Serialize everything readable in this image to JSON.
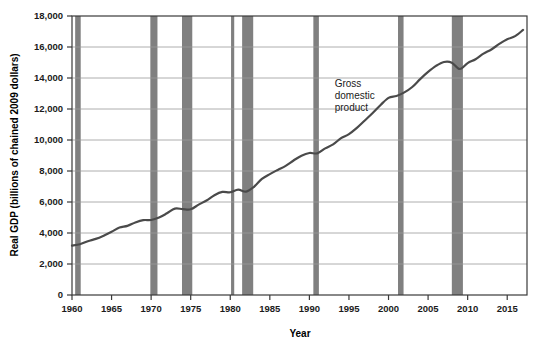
{
  "chart_data": {
    "type": "line",
    "title": "",
    "xlabel": "Year",
    "ylabel": "Real GDP (billions of chained 2009 dollars)",
    "xlim": [
      1960,
      2017.5
    ],
    "ylim": [
      0,
      18000
    ],
    "grid": true,
    "legend_position": "none",
    "x_ticks": [
      "1960",
      "1965",
      "1970",
      "1975",
      "1980",
      "1985",
      "1990",
      "1995",
      "2000",
      "2005",
      "2015"
    ],
    "x_tick_values": [
      1960,
      1965,
      1970,
      1975,
      1980,
      1985,
      1990,
      1995,
      2000,
      2005,
      2010,
      2015
    ],
    "x_tick_labels": [
      "1960",
      "1965",
      "1970",
      "1975",
      "1980",
      "1985",
      "1990",
      "1995",
      "2000",
      "2005",
      "2010",
      "2015"
    ],
    "y_ticks": [
      0,
      2000,
      4000,
      6000,
      8000,
      10000,
      12000,
      14000,
      16000,
      18000
    ],
    "y_tick_labels": [
      "0",
      "2,000",
      "4,000",
      "6,000",
      "8,000",
      "10,000",
      "12,000",
      "14,000",
      "16,000",
      "18,000"
    ],
    "series": [
      {
        "name": "Gross domestic product",
        "color": "#4a4a4a",
        "x": [
          1960,
          1961,
          1962,
          1963,
          1964,
          1965,
          1966,
          1967,
          1968,
          1969,
          1970,
          1971,
          1972,
          1973,
          1974,
          1975,
          1976,
          1977,
          1978,
          1979,
          1980,
          1981,
          1982,
          1983,
          1984,
          1985,
          1986,
          1987,
          1988,
          1989,
          1990,
          1991,
          1992,
          1993,
          1994,
          1995,
          1996,
          1997,
          1998,
          1999,
          2000,
          2001,
          2002,
          2003,
          2004,
          2005,
          2006,
          2007,
          2008,
          2009,
          2010,
          2011,
          2012,
          2013,
          2014,
          2015,
          2016,
          2017
        ],
        "values": [
          3190,
          3270,
          3470,
          3620,
          3830,
          4080,
          4350,
          4460,
          4680,
          4830,
          4840,
          5000,
          5270,
          5570,
          5540,
          5530,
          5830,
          6100,
          6440,
          6650,
          6630,
          6800,
          6670,
          6980,
          7490,
          7800,
          8070,
          8330,
          8680,
          8990,
          9160,
          9140,
          9460,
          9720,
          10120,
          10380,
          10780,
          11260,
          11740,
          12260,
          12720,
          12840,
          13070,
          13420,
          13930,
          14390,
          14780,
          15030,
          14990,
          14580,
          14960,
          15210,
          15570,
          15840,
          16200,
          16500,
          16700,
          17100
        ]
      }
    ],
    "recession_bands": [
      {
        "label": "1960-61 recession",
        "start": 1960.4,
        "end": 1961.1
      },
      {
        "label": "1970 recession",
        "start": 1969.9,
        "end": 1970.8
      },
      {
        "label": "1973-75 recession",
        "start": 1973.9,
        "end": 1975.2
      },
      {
        "label": "1980 recession",
        "start": 1980.1,
        "end": 1980.5
      },
      {
        "label": "1981-82 recession",
        "start": 1981.5,
        "end": 1982.9
      },
      {
        "label": "1990-91 recession",
        "start": 1990.5,
        "end": 1991.2
      },
      {
        "label": "2001 recession",
        "start": 2001.2,
        "end": 2001.9
      },
      {
        "label": "2008-09 recession",
        "start": 2008.0,
        "end": 2009.4
      }
    ],
    "annotations": [
      {
        "name": "gdp-series-annotation",
        "lines": [
          "Gross",
          "domestic",
          "product"
        ],
        "x": 1993.2,
        "y": 13400
      }
    ]
  },
  "style": {
    "line_color": "#4a4a4a",
    "band_color": "#808080",
    "grid_color": "#9a9a9a",
    "axis_color": "#3a3a3a",
    "background": "#ffffff"
  }
}
